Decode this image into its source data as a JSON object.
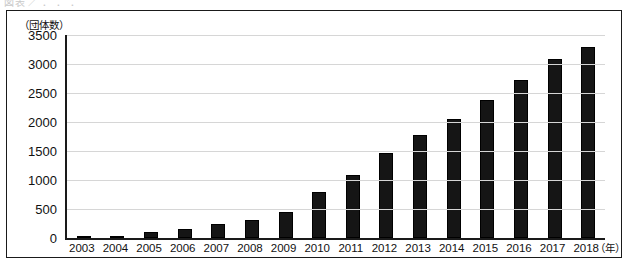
{
  "scan_artifact": {
    "cut_caption": "図表  ／  ．  ．  ．"
  },
  "figure": {
    "y_unit_label": "（団体数）",
    "x_unit_label": "（年）"
  },
  "chart_data": {
    "type": "bar",
    "title": "",
    "subtitle": "",
    "xlabel": "（年）",
    "ylabel": "（団体数）",
    "categories": [
      "2003",
      "2004",
      "2005",
      "2006",
      "2007",
      "2008",
      "2009",
      "2010",
      "2011",
      "2012",
      "2013",
      "2014",
      "2015",
      "2016",
      "2017",
      "2018"
    ],
    "values": [
      0,
      30,
      110,
      160,
      240,
      310,
      440,
      790,
      1090,
      1460,
      1770,
      2060,
      2380,
      2720,
      3090,
      3290
    ],
    "ylim": [
      0,
      3500
    ],
    "ytick_step": 500,
    "yticks": [
      "3500",
      "3000",
      "2500",
      "2000",
      "1500",
      "1000",
      "500",
      "0"
    ],
    "grid": "horizontal",
    "legend": "none",
    "bar_color": "#151515",
    "grid_color": "#d6d6d6",
    "axis_color": "#1a1a1a"
  }
}
